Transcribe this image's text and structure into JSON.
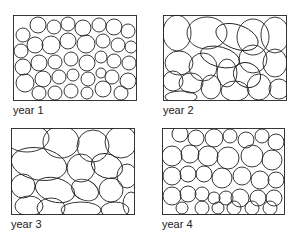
{
  "figure": {
    "panels": [
      {
        "label": "year 1",
        "box": {
          "x": 13,
          "y": 15,
          "w": 124,
          "h": 86
        },
        "label_pos": {
          "x": 13,
          "y": 104
        }
      },
      {
        "label": "year 2",
        "box": {
          "x": 163,
          "y": 15,
          "w": 124,
          "h": 86
        },
        "label_pos": {
          "x": 163,
          "y": 104
        }
      },
      {
        "label": "year 3",
        "box": {
          "x": 11,
          "y": 128,
          "w": 124,
          "h": 87
        },
        "label_pos": {
          "x": 11,
          "y": 218
        }
      },
      {
        "label": "year 4",
        "box": {
          "x": 162,
          "y": 128,
          "w": 123,
          "h": 87
        },
        "label_pos": {
          "x": 162,
          "y": 218
        }
      }
    ],
    "stroke_color": "#222222",
    "background": "#ffffff"
  }
}
